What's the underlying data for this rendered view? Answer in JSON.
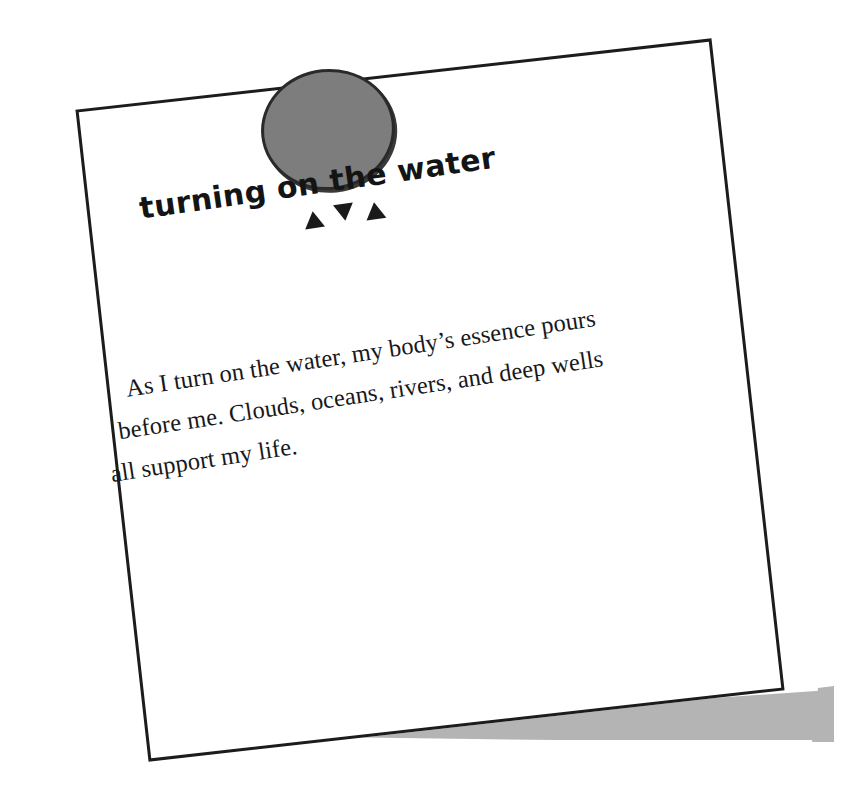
{
  "card": {
    "title": "turning on the water",
    "ornament": {
      "icons": [
        "triangle-up",
        "triangle-down",
        "triangle-up"
      ],
      "glyphs": [
        "▲",
        "▼",
        "▲"
      ]
    },
    "body_lines": [
      "As I turn on the water, my body’s essence pours",
      "before me. Clouds, oceans, rivers, and deep wells",
      "all support my life."
    ],
    "body_text": "As I turn on the water, my body’s essence pours before me. Clouds, oceans, rivers, and deep wells all support my life."
  },
  "decor": {
    "magnet": {
      "name": "magnet-dot",
      "fill": "#7d7d7d",
      "outline": "#2a2a2a"
    },
    "paper": {
      "fill": "#ffffff",
      "border": "#1c1c1c",
      "rotation_deg": -6.4
    },
    "shadow": {
      "fill": "#b4b4b4"
    }
  },
  "colors": {
    "background": "#ffffff",
    "ink": "#18181a",
    "title_ink": "#141414",
    "gray": "#7d7d7d",
    "shadow_gray": "#b4b4b4",
    "outline": "#1c1c1c"
  }
}
